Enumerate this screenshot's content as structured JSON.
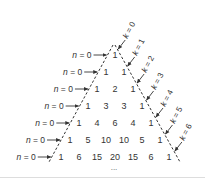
{
  "diagram": {
    "row_label_text": "n = 0",
    "row_labels": [
      "n = 0",
      "n = 0",
      "n = 0",
      "n = 0",
      "n = 0",
      "n = 0",
      "n = 0"
    ],
    "diagonal_labels": [
      "k = 0",
      "k = 1",
      "k = 2",
      "k = 3",
      "k = 4",
      "k = 5",
      "k = 6"
    ],
    "rows": [
      [
        "1"
      ],
      [
        "1",
        "1"
      ],
      [
        "1",
        "2",
        "1"
      ],
      [
        "1",
        "3",
        "3",
        "1"
      ],
      [
        "1",
        "4",
        "6",
        "4",
        "1"
      ],
      [
        "1",
        "5",
        "10",
        "10",
        "5",
        "1"
      ],
      [
        "1",
        "6",
        "15",
        "20",
        "15",
        "6",
        "1"
      ]
    ],
    "continuation": "...",
    "colors": {
      "text": "#333333",
      "lines": "#333333",
      "background": "#ffffff"
    }
  }
}
